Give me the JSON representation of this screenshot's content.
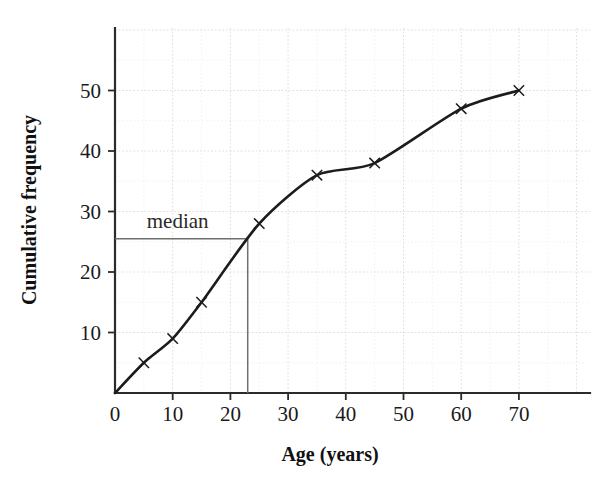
{
  "chart_data": {
    "type": "line",
    "title": "",
    "xlabel": "Age (years)",
    "ylabel": "Cumulative frequency",
    "xlim": [
      0,
      82
    ],
    "ylim": [
      0,
      60
    ],
    "xticks": [
      0,
      10,
      20,
      30,
      40,
      50,
      60,
      70
    ],
    "yticks": [
      10,
      20,
      30,
      40,
      50
    ],
    "xtick_labels": [
      "0",
      "10",
      "20",
      "30",
      "40",
      "50",
      "60",
      "70"
    ],
    "ytick_labels": [
      "10",
      "20",
      "30",
      "40",
      "50"
    ],
    "grid": true,
    "grid_minor_step_x": 5,
    "grid_minor_step_y": 5,
    "legend": "none",
    "series": [
      {
        "name": "Cumulative frequency",
        "marker": "x",
        "color": "#1c1c1c",
        "x": [
          0,
          5,
          10,
          15,
          25,
          35,
          45,
          60,
          70
        ],
        "y": [
          0,
          5,
          9,
          15,
          28,
          36,
          38,
          47,
          50
        ]
      }
    ],
    "annotations": [
      {
        "name": "median",
        "label": "median",
        "value_y": 25.5,
        "value_x": 23,
        "color": "#6f6f6f",
        "label_x": 5.5,
        "label_y": 28.5
      }
    ]
  },
  "axis": {
    "x_title": "Age (years)",
    "y_title": "Cumulative frequency"
  }
}
